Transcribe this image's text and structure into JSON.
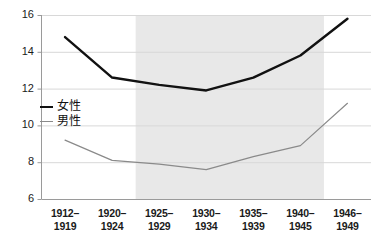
{
  "chart_data": {
    "type": "line",
    "title": "",
    "subtitle": "",
    "xlabel": "",
    "ylabel": "",
    "grid": true,
    "legend_position": "inside-left",
    "categories": [
      "1912–1919",
      "1920–1924",
      "1925–1929",
      "1930–1934",
      "1935–1939",
      "1940–1945",
      "1946–1949"
    ],
    "series": [
      {
        "name": "女性",
        "color": "#111111",
        "width": 2.4,
        "values": [
          14.8,
          12.6,
          12.2,
          11.9,
          12.6,
          13.8,
          15.8
        ]
      },
      {
        "name": "男性",
        "color": "#8a8a8a",
        "width": 1.2,
        "values": [
          9.2,
          8.1,
          7.9,
          7.6,
          8.3,
          8.9,
          11.2
        ]
      }
    ],
    "ylim": [
      6,
      16
    ],
    "yticks": [
      6,
      8,
      10,
      12,
      14,
      16
    ],
    "ytick_labels": [
      "6",
      "8",
      "10",
      "12",
      "14",
      "16"
    ],
    "shaded_band": {
      "from_category": "1925–1929",
      "to_category": "1940–1945",
      "color": "#e8e8e8"
    }
  },
  "legend": {
    "items": [
      {
        "label": "女性"
      },
      {
        "label": "男性"
      }
    ]
  },
  "axes": {
    "y_labels": [
      "16",
      "14",
      "12",
      "10",
      "8",
      "6"
    ],
    "x_labels": [
      {
        "line1": "1912–",
        "line2": "1919"
      },
      {
        "line1": "1920–",
        "line2": "1924"
      },
      {
        "line1": "1925–",
        "line2": "1929"
      },
      {
        "line1": "1930–",
        "line2": "1934"
      },
      {
        "line1": "1935–",
        "line2": "1939"
      },
      {
        "line1": "1940–",
        "line2": "1945"
      },
      {
        "line1": "1946–",
        "line2": "1949"
      }
    ]
  },
  "colors": {
    "female_line": "#111111",
    "male_line": "#8a8a8a",
    "gridline": "#d8d8d8",
    "axis": "#9a9a9a",
    "band": "#e8e8e8",
    "background": "#ffffff",
    "text": "#1a1a1a"
  }
}
